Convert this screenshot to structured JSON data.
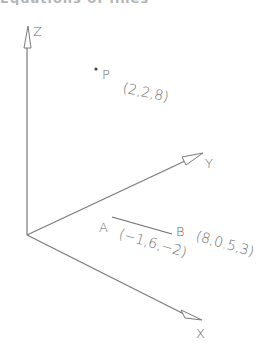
{
  "header": {
    "clipped_title": "Equations of lines"
  },
  "diagram": {
    "axes": {
      "z": {
        "label": "Z"
      },
      "y": {
        "label": "Y"
      },
      "x": {
        "label": "X"
      }
    },
    "points": {
      "p": {
        "label": "P",
        "coords": "(2,2,8)"
      },
      "a": {
        "label": "A",
        "coords": "(−1,6,−2)"
      },
      "b": {
        "label": "B",
        "coords": "(8,0.5,3)"
      }
    },
    "colors": {
      "line": "#7a7a7a",
      "text": "#6a6a6a",
      "background": "#ffffff"
    }
  }
}
